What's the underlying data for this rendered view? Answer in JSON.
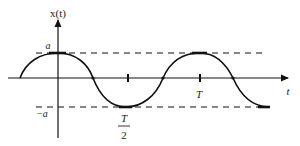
{
  "diagram": {
    "type": "cosine-waveform",
    "y_axis_label": "x(t)",
    "x_axis_label": "t",
    "amplitude_label_pos": "a",
    "amplitude_label_neg": "−a",
    "tick_labels": {
      "half_period_num": "T",
      "half_period_den": "2",
      "period": "T"
    },
    "colors": {
      "stroke": "#111111",
      "text": "#222222",
      "background": "#ffffff"
    }
  }
}
